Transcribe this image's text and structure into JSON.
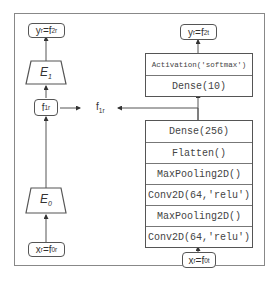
{
  "diagram": {
    "left_branch": {
      "output_box": {
        "var": "y",
        "var_sub": "r",
        "eq": "=f",
        "eq_sub": "2r"
      },
      "encoder_top": {
        "symbol": "E",
        "sub": "1"
      },
      "feature_box": {
        "var": "f",
        "var_sub": "1r"
      },
      "encoder_bottom": {
        "symbol": "E",
        "sub": "0"
      },
      "input_box": {
        "var": "x",
        "var_sub": "r",
        "eq": "=f",
        "eq_sub": "0r"
      }
    },
    "shared_feature_label": {
      "var": "f",
      "var_sub": "1r"
    },
    "right_branch": {
      "output_box": {
        "var": "y",
        "var_sub": "r",
        "eq": "=f",
        "eq_sub": "2t"
      },
      "head_layers": [
        "Activation('softmax')",
        "Dense(10)"
      ],
      "body_layers": [
        "Dense(256)",
        "Flatten()",
        "MaxPooling2D()",
        "Conv2D(64,'relu')",
        "MaxPooling2D()",
        "Conv2D(64,'relu')"
      ],
      "input_box": {
        "var": "x",
        "var_sub": "r",
        "eq": "=f",
        "eq_sub": "0t"
      }
    },
    "colors": {
      "line": "#555555",
      "frame": "#888888",
      "text": "#333333"
    }
  }
}
